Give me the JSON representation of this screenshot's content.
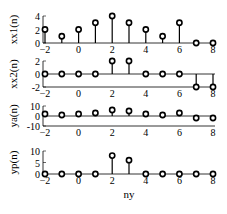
{
  "chart_data": [
    {
      "type": "stem",
      "ylabel": "xx1(n)",
      "x": [
        -2,
        -1,
        0,
        1,
        2,
        3,
        4,
        5,
        6,
        7,
        8
      ],
      "values": [
        2,
        1,
        2,
        3,
        4,
        3,
        2,
        1,
        3,
        0,
        0
      ],
      "ylim": [
        0,
        4
      ],
      "yticks": [
        0,
        2,
        4
      ],
      "xticks": [
        -2,
        0,
        2,
        4,
        6,
        8
      ]
    },
    {
      "type": "stem",
      "ylabel": "xx2(n)",
      "x": [
        -2,
        -1,
        0,
        1,
        2,
        3,
        4,
        5,
        6,
        7,
        8
      ],
      "values": [
        0,
        0,
        0,
        0,
        2,
        2,
        0,
        0,
        0,
        -2,
        -2
      ],
      "ylim": [
        -2,
        2
      ],
      "yticks": [
        -2,
        0,
        2
      ],
      "xticks": [
        -2,
        0,
        2,
        4,
        6,
        8
      ]
    },
    {
      "type": "stem",
      "ylabel": "ya(n)",
      "x": [
        -2,
        -1,
        0,
        1,
        2,
        3,
        4,
        5,
        6,
        7,
        8
      ],
      "values": [
        2,
        1,
        2,
        3,
        6,
        5,
        2,
        1,
        3,
        -2,
        -2
      ],
      "ylim": [
        -10,
        10
      ],
      "yticks": [
        -10,
        0,
        10
      ],
      "xticks": [
        -2,
        0,
        2,
        4,
        6,
        8
      ]
    },
    {
      "type": "stem",
      "ylabel": "yp(n)",
      "xlabel": "ny",
      "x": [
        -2,
        -1,
        0,
        1,
        2,
        3,
        4,
        5,
        6,
        7,
        8
      ],
      "values": [
        0,
        0,
        0,
        0,
        8,
        6,
        0,
        0,
        0,
        0,
        0
      ],
      "ylim": [
        0,
        10
      ],
      "yticks": [
        0,
        5,
        10
      ],
      "xticks": [
        -2,
        0,
        2,
        4,
        6,
        8
      ]
    }
  ]
}
